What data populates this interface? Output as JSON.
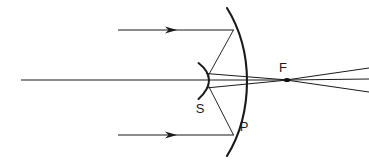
{
  "figure": {
    "background_color": "#ffffff",
    "stroke_color": "#1a1a1a",
    "width": 369,
    "height": 163
  },
  "labels": {
    "focus": "F",
    "secondary_mirror": "S",
    "primary_mirror": "P"
  },
  "label_positions": {
    "focus": {
      "x": 283,
      "y": 72
    },
    "secondary_mirror": {
      "x": 197,
      "y": 113
    },
    "primary_mirror": {
      "x": 241,
      "y": 131
    }
  },
  "elements": {
    "optical_axis": {
      "name": "optical-axis",
      "x1": 21,
      "y1": 80,
      "x2": 205,
      "y2": 80
    },
    "incoming_ray_top": {
      "name": "incoming-ray-top",
      "x1": 118,
      "y1": 30,
      "x2": 233,
      "y2": 30,
      "arrow_x": 172,
      "arrow_y": 30
    },
    "incoming_ray_bottom": {
      "name": "incoming-ray-bottom",
      "x1": 118,
      "y1": 135,
      "x2": 233,
      "y2": 135,
      "arrow_x": 172,
      "arrow_y": 135
    },
    "primary_mirror_arc": {
      "name": "primary-mirror-arc",
      "path": "M 227 8 Q 256 81 227 155",
      "top_point": {
        "x": 227,
        "y": 8
      },
      "bottom_point": {
        "x": 227,
        "y": 155
      },
      "vertex": {
        "x": 246,
        "y": 81
      }
    },
    "secondary_mirror_arc": {
      "name": "secondary-mirror-arc",
      "path": "M 199 64 Q 214 80 199 98",
      "top_point": {
        "x": 199,
        "y": 64
      },
      "bottom_point": {
        "x": 199,
        "y": 98
      },
      "vertex": {
        "x": 209,
        "y": 80
      }
    },
    "reflected_ray_top": {
      "name": "reflected-ray-top-to-secondary",
      "x1": 233,
      "y1": 30,
      "x2": 208,
      "y2": 78
    },
    "reflected_ray_bottom": {
      "name": "reflected-ray-bottom-to-secondary",
      "x1": 233,
      "y1": 135,
      "x2": 208,
      "y2": 84
    },
    "converging_ray_upper": {
      "name": "converging-ray-upper-to-focus",
      "x1": 207,
      "y1": 74,
      "x2": 287,
      "y2": 80
    },
    "converging_ray_lower": {
      "name": "converging-ray-lower-to-focus",
      "x1": 207,
      "y1": 87,
      "x2": 287,
      "y2": 80
    },
    "converging_ray_axis": {
      "name": "converging-ray-axis-to-focus",
      "x1": 207,
      "y1": 80,
      "x2": 287,
      "y2": 80
    },
    "diverging_ray_upper": {
      "name": "diverging-ray-upper-past-focus",
      "x1": 287,
      "y1": 80,
      "x2": 369,
      "y2": 68
    },
    "diverging_ray_middle": {
      "name": "diverging-ray-middle-past-focus",
      "x1": 287,
      "y1": 80,
      "x2": 369,
      "y2": 80
    },
    "diverging_ray_lower": {
      "name": "diverging-ray-lower-past-focus",
      "x1": 287,
      "y1": 80,
      "x2": 369,
      "y2": 92
    },
    "focal_point_dot": {
      "name": "focal-point-dot",
      "cx": 287,
      "cy": 80,
      "rx": 3.2,
      "ry": 1.9
    }
  }
}
